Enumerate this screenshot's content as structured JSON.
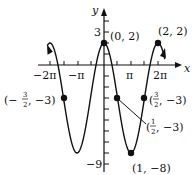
{
  "figure": {
    "axes": {
      "x_label": "x",
      "y_label": "y"
    },
    "x_ticks": [
      "−2π",
      "−π",
      "π",
      "2π"
    ],
    "y_ticks": [
      "3",
      "−9"
    ],
    "points": [
      {
        "label": "(0, 2)",
        "x": 0,
        "y": 2
      },
      {
        "label": "(2, 2)",
        "x": 2,
        "y": 2
      },
      {
        "label": "(1, −8)",
        "x": 1,
        "y": -8
      },
      {
        "label": "(−¾⁄₂, −3)",
        "x": -1.5,
        "y": -3
      },
      {
        "label": "(½, −3)",
        "x": 0.5,
        "y": -3
      },
      {
        "label": "(3/2, −3)",
        "x": 1.5,
        "y": -3
      }
    ],
    "labels": {
      "p00": "(0, 2)",
      "p22": "(2, 2)",
      "pmin": "(1, −8)",
      "pm32_pre": "(−",
      "pm32_num": "3",
      "pm32_den": "2",
      "pm32_post": ", −3)",
      "p12_pre": "(",
      "p12_num": "1",
      "p12_den": "2",
      "p12_post": ", −3)",
      "p32_pre": "(",
      "p32_num": "3",
      "p32_den": "2",
      "p32_post": ", −3)",
      "tick_m2pi": "−2π",
      "tick_mpi": "−π",
      "tick_pi": "π",
      "tick_2pi": "2π",
      "tick_3": "3",
      "tick_m9": "−9",
      "xaxis": "x",
      "yaxis": "y"
    }
  }
}
